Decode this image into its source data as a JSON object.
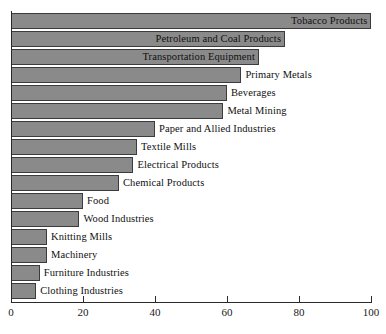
{
  "chart_data": {
    "type": "bar",
    "orientation": "horizontal",
    "title": "",
    "subtitle": "",
    "xlabel": "",
    "ylabel": "",
    "xlim": [
      0,
      100
    ],
    "xticks": [
      0,
      20,
      40,
      60,
      80,
      100
    ],
    "xtick_labels": [
      "0",
      "20",
      "40",
      "60",
      "80",
      "100"
    ],
    "grid": false,
    "legend": false,
    "bar_fill_color": "#8a8a8a",
    "bar_edge_color": "#3b3b3b",
    "background_color": "#ffffff",
    "categories": [
      "Tobacco Products",
      "Petroleum and Coal Products",
      "Transportation Equipment",
      "Primary Metals",
      "Beverages",
      "Metal Mining",
      "Paper and Allied Industries",
      "Textile Mills",
      "Electrical Products",
      "Chemical Products",
      "Food",
      "Wood Industries",
      "Knitting Mills",
      "Machinery",
      "Furniture Industries",
      "Clothing Industries"
    ],
    "values": [
      100,
      76,
      69,
      64,
      60,
      59,
      40,
      35,
      34,
      30,
      20,
      19,
      10,
      10,
      8,
      7
    ],
    "bars": [
      {
        "label": "Tobacco Products",
        "value": 100,
        "label_position": "inside"
      },
      {
        "label": "Petroleum and Coal Products",
        "value": 76,
        "label_position": "inside"
      },
      {
        "label": "Transportation Equipment",
        "value": 69,
        "label_position": "inside"
      },
      {
        "label": "Primary Metals",
        "value": 64,
        "label_position": "outside"
      },
      {
        "label": "Beverages",
        "value": 60,
        "label_position": "outside"
      },
      {
        "label": "Metal Mining",
        "value": 59,
        "label_position": "outside"
      },
      {
        "label": "Paper and Allied Industries",
        "value": 40,
        "label_position": "outside"
      },
      {
        "label": "Textile Mills",
        "value": 35,
        "label_position": "outside"
      },
      {
        "label": "Electrical Products",
        "value": 34,
        "label_position": "outside"
      },
      {
        "label": "Chemical Products",
        "value": 30,
        "label_position": "outside"
      },
      {
        "label": "Food",
        "value": 20,
        "label_position": "outside"
      },
      {
        "label": "Wood Industries",
        "value": 19,
        "label_position": "outside"
      },
      {
        "label": "Knitting Mills",
        "value": 10,
        "label_position": "outside"
      },
      {
        "label": "Machinery",
        "value": 10,
        "label_position": "outside"
      },
      {
        "label": "Furniture Industries",
        "value": 8,
        "label_position": "outside"
      },
      {
        "label": "Clothing Industries",
        "value": 7,
        "label_position": "outside"
      }
    ]
  }
}
